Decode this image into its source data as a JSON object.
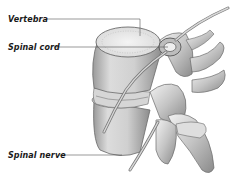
{
  "diagram": {
    "labels": [
      {
        "text": "Vertebra",
        "x": 8,
        "y": 15
      },
      {
        "text": "Spinal cord",
        "x": 8,
        "y": 43
      },
      {
        "text": "Spinal nerve",
        "x": 8,
        "y": 151
      }
    ],
    "colors": {
      "label_text": "#1a1a1a",
      "leader_line": "#555555",
      "bone_light": "#eeeeee",
      "bone_mid": "#c8c8c8",
      "bone_dark": "#8a8a8a",
      "outline": "#6a6a6a"
    }
  }
}
